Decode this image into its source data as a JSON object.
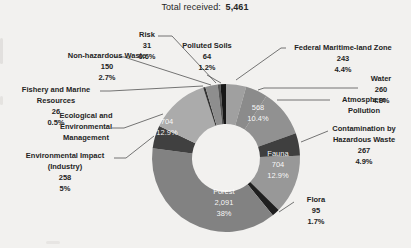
{
  "chart_data": {
    "type": "donut",
    "total_label": "Total received:",
    "total_value": "5,461",
    "start_angle_deg": 0,
    "direction": "clockwise",
    "slices": [
      {
        "label": "Federal Maritime-land Zone",
        "value": "243",
        "pct": "4.4%",
        "pct_num": 4.4,
        "color": "#a0a0a0"
      },
      {
        "label": "Water",
        "value": "260",
        "pct": "4.8%",
        "pct_num": 4.8,
        "color": "#8b8b8b"
      },
      {
        "label": "Atmosphere Pollution",
        "value": "568",
        "pct": "10.4%",
        "pct_num": 10.4,
        "color": "#919191"
      },
      {
        "label": "Contamination by Hazardous Waste",
        "value": "267",
        "pct": "4.9%",
        "pct_num": 4.9,
        "color": "#3f3f3f"
      },
      {
        "label": "Fauna",
        "value": "704",
        "pct": "12.9%",
        "pct_num": 12.9,
        "color": "#989898"
      },
      {
        "label": "Flora",
        "value": "95",
        "pct": "1.7%",
        "pct_num": 1.7,
        "color": "#1f1f1f"
      },
      {
        "label": "Forest",
        "value": "2,091",
        "pct": "38%",
        "pct_num": 38.0,
        "color": "#828282"
      },
      {
        "label": "Environmental Impact (Industry)",
        "value": "258",
        "pct": "5%",
        "pct_num": 5.0,
        "color": "#404040"
      },
      {
        "label": "Ecological and Environmental Management",
        "value": "704",
        "pct": "12.9%",
        "pct_num": 12.9,
        "color": "#ababab"
      },
      {
        "label": "Fishery and Marine Resources",
        "value": "26",
        "pct": "0.5%",
        "pct_num": 0.5,
        "color": "#333333"
      },
      {
        "label": "Non-hazardous Waste",
        "value": "150",
        "pct": "2.7%",
        "pct_num": 2.7,
        "color": "#8e8e8e"
      },
      {
        "label": "Risk",
        "value": "31",
        "pct": "0.6%",
        "pct_num": 0.6,
        "color": "#555555"
      },
      {
        "label": "Polluted Soils",
        "value": "64",
        "pct": "1.2%",
        "pct_num": 1.2,
        "color": "#171717"
      }
    ]
  }
}
